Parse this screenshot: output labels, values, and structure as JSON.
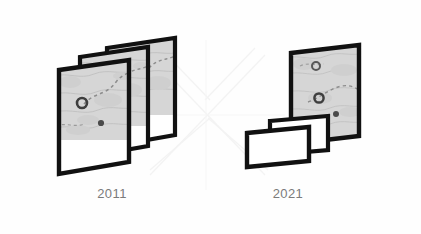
{
  "figure": {
    "background_color": "#fefefe",
    "stroke_color": "#111111",
    "map_fill_color": "#d8d8d8",
    "blank_fill_color": "#ffffff",
    "label_color": "#7b7b7b",
    "watermark_color": "#f4f4f4"
  },
  "groups": [
    {
      "id": "group-2011",
      "year_label": "2011",
      "card_count": 3,
      "cards": [
        {
          "name": "map-card-back",
          "type": "map",
          "marker_rings": 1,
          "marker_dots": 1
        },
        {
          "name": "map-card-middle",
          "type": "map",
          "marker_rings": 1,
          "marker_dots": 1
        },
        {
          "name": "map-card-front",
          "type": "map",
          "marker_rings": 1,
          "marker_dots": 1
        }
      ]
    },
    {
      "id": "group-2021",
      "year_label": "2021",
      "card_count": 3,
      "cards": [
        {
          "name": "map-card-back",
          "type": "map",
          "marker_rings": 2,
          "marker_dots": 1
        },
        {
          "name": "blank-card-middle",
          "type": "blank",
          "marker_rings": 0,
          "marker_dots": 0
        },
        {
          "name": "blank-card-front",
          "type": "blank",
          "marker_rings": 0,
          "marker_dots": 0
        }
      ]
    }
  ]
}
